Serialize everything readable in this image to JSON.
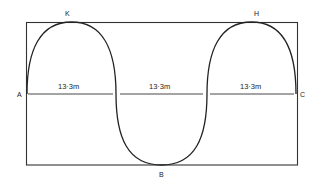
{
  "diagram": {
    "points": {
      "A": "A",
      "B": "B",
      "C": "C",
      "H": "H",
      "K": "K"
    },
    "segments": [
      {
        "label": "13·3m"
      },
      {
        "label": "13·3m"
      },
      {
        "label": "13·3m"
      }
    ],
    "colors": {
      "line": "#222222",
      "background": "#ffffff"
    }
  }
}
